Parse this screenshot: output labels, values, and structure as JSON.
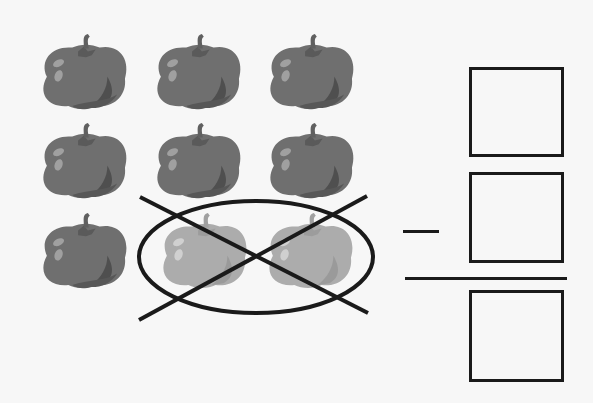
{
  "worksheet": {
    "tomatoes": {
      "total": 9,
      "crossed_out": 2,
      "rows": [
        {
          "count": 3,
          "crossed": 0
        },
        {
          "count": 3,
          "crossed": 0
        },
        {
          "count": 3,
          "crossed": 2
        }
      ],
      "colors": {
        "body": "#707070",
        "dark": "#505050",
        "highlight": "#a0a0a0",
        "faded_body": "#ababab",
        "faded_dark": "#979797",
        "faded_highlight": "#cfcfcf"
      }
    },
    "equation": {
      "operator": "minus",
      "answer_boxes": [
        "",
        "",
        ""
      ]
    }
  }
}
